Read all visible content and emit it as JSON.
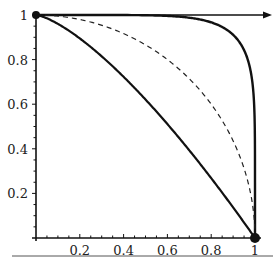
{
  "chart_data": {
    "type": "line",
    "title": "",
    "xlabel": "",
    "ylabel": "",
    "xlim": [
      0,
      1
    ],
    "ylim": [
      0,
      1
    ],
    "x_ticks": [
      "0.2",
      "0.4",
      "0.6",
      "0.8",
      "1"
    ],
    "y_ticks": [
      "0.2",
      "0.4",
      "0.6",
      "0.8",
      "1"
    ],
    "grid": false,
    "legend": null,
    "series": [
      {
        "name": "outer curve (near-square)",
        "style": "solid",
        "x": [
          0,
          0.5,
          0.8,
          0.9,
          0.95,
          0.98,
          1.0
        ],
        "y": [
          1.0,
          0.995,
          0.97,
          0.92,
          0.83,
          0.65,
          0
        ]
      },
      {
        "name": "quarter circle",
        "style": "dashed",
        "x": [
          0,
          0.2,
          0.4,
          0.6,
          0.8,
          0.9,
          1.0
        ],
        "y": [
          1.0,
          0.98,
          0.92,
          0.8,
          0.6,
          0.44,
          0
        ]
      },
      {
        "name": "inner curve",
        "style": "solid",
        "x": [
          0,
          0.2,
          0.4,
          0.6,
          0.8,
          0.9,
          1.0
        ],
        "y": [
          1.0,
          0.9,
          0.72,
          0.51,
          0.27,
          0.14,
          0
        ]
      }
    ],
    "annotations": [
      {
        "type": "point",
        "x": 0,
        "y": 1
      },
      {
        "type": "point",
        "x": 1,
        "y": 0
      }
    ]
  }
}
